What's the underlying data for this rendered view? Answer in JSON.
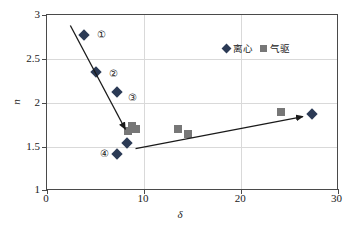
{
  "chart_data": {
    "type": "scatter",
    "title": "",
    "xlabel": "δ",
    "ylabel": "n",
    "xlim": [
      0,
      30
    ],
    "ylim": [
      1,
      3
    ],
    "xticks": [
      "0",
      "10",
      "20",
      "30"
    ],
    "xtick_values": [
      0,
      10,
      20,
      30
    ],
    "yticks": [
      "1",
      "1.5",
      "2",
      "2.5",
      "3"
    ],
    "ytick_values": [
      1,
      1.5,
      2,
      2.5,
      3
    ],
    "grid": {
      "horizontal": [
        1.5,
        2,
        2.5
      ],
      "vertical": [
        10,
        20
      ],
      "color": "#d9d9d9"
    },
    "legend": {
      "position": "top-right",
      "entries": [
        {
          "label": "离心",
          "marker": "diamond",
          "color": "#2b3a55"
        },
        {
          "label": "气驱",
          "marker": "square",
          "color": "#777777"
        }
      ]
    },
    "series": [
      {
        "name": "离心",
        "marker": "diamond",
        "color": "#2b3a55",
        "points": [
          {
            "x": 3.8,
            "y": 2.77
          },
          {
            "x": 5.0,
            "y": 2.35
          },
          {
            "x": 7.2,
            "y": 2.12
          },
          {
            "x": 8.2,
            "y": 1.55
          },
          {
            "x": 7.2,
            "y": 1.42
          },
          {
            "x": 27.2,
            "y": 1.87
          }
        ]
      },
      {
        "name": "气驱",
        "marker": "square",
        "color": "#777777",
        "points": [
          {
            "x": 8.3,
            "y": 1.68
          },
          {
            "x": 8.7,
            "y": 1.74
          },
          {
            "x": 9.1,
            "y": 1.71
          },
          {
            "x": 13.5,
            "y": 1.71
          },
          {
            "x": 14.5,
            "y": 1.65
          },
          {
            "x": 24.0,
            "y": 1.9
          }
        ]
      }
    ],
    "annotations": [
      {
        "text": "①",
        "x": 5.6,
        "y": 2.77
      },
      {
        "text": "②",
        "x": 6.8,
        "y": 2.33
      },
      {
        "text": "③",
        "x": 8.8,
        "y": 2.06
      },
      {
        "text": "④",
        "x": 5.9,
        "y": 1.42
      }
    ],
    "arrows": [
      {
        "name": "descending-trend-arrow",
        "x1": 2.5,
        "y1": 2.87,
        "x2": 8.15,
        "y2": 1.69,
        "color": "#1a1a1a"
      },
      {
        "name": "ascending-trend-arrow",
        "x1": 9.2,
        "y1": 1.47,
        "x2": 26.4,
        "y2": 1.835,
        "color": "#1a1a1a"
      }
    ]
  }
}
